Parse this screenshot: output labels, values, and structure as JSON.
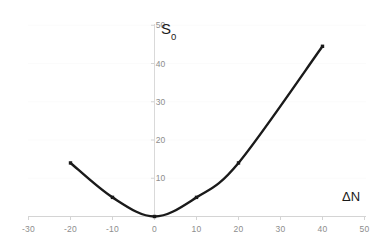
{
  "chart_data": {
    "type": "line",
    "title": "",
    "subtitle": "",
    "xlabel": "ΔN",
    "ylabel": "S₀",
    "ylabel_base": "S",
    "ylabel_sub": "0",
    "xlim": [
      -30,
      50
    ],
    "ylim": [
      0,
      50
    ],
    "xticks": [
      -30,
      -20,
      -10,
      0,
      10,
      20,
      30,
      40,
      50
    ],
    "xtick_labels": [
      "-30",
      "-20",
      "-10",
      "0",
      "10",
      "20",
      "30",
      "40",
      "50"
    ],
    "yticks": [
      10,
      20,
      30,
      40,
      50
    ],
    "ytick_labels": [
      "10",
      "20",
      "30",
      "40",
      "50"
    ],
    "grid": "y-gridlines-light",
    "legend": "none",
    "markers": "small filled squares",
    "line_color": "#1a1a1a",
    "line_width": 2.4,
    "axis_color": "#d4d4d4",
    "tick_label_color": "#8d8d8d",
    "background_color": "#ffffff",
    "x": [
      -20,
      -10,
      0,
      10,
      20,
      40
    ],
    "y": [
      14,
      5,
      0,
      5,
      14,
      44.5
    ],
    "series": [
      {
        "name": "S0 vs dN",
        "points": [
          {
            "x": -20,
            "y": 14
          },
          {
            "x": -10,
            "y": 5
          },
          {
            "x": 0,
            "y": 0
          },
          {
            "x": 10,
            "y": 5
          },
          {
            "x": 20,
            "y": 14
          },
          {
            "x": 40,
            "y": 44.5
          }
        ]
      }
    ],
    "annotations": []
  }
}
